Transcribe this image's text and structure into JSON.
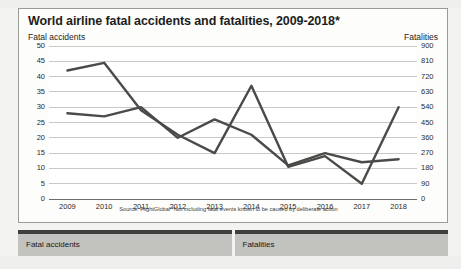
{
  "chart_data": {
    "type": "line",
    "title": "World airline fatal accidents and fatalities, 2009-2018*",
    "xlabel": "",
    "ylabel": "Fatal accidents",
    "y2label": "Fatalities",
    "categories": [
      "2009",
      "2010",
      "2011",
      "2012",
      "2013",
      "2014",
      "2015",
      "2016",
      "2017",
      "2018"
    ],
    "ylim": [
      0,
      50
    ],
    "y2lim": [
      0,
      900
    ],
    "yticks": [
      0,
      5,
      10,
      15,
      20,
      25,
      30,
      35,
      40,
      45,
      50
    ],
    "y2ticks": [
      0,
      90,
      180,
      270,
      360,
      450,
      540,
      630,
      720,
      810,
      900
    ],
    "grid": true,
    "legend_position": "bottom",
    "series": [
      {
        "name": "Fatal accidents",
        "axis": "left",
        "color": "#4a4a48",
        "values": [
          28,
          27,
          30,
          20,
          26,
          21,
          11,
          15,
          12,
          13
        ]
      },
      {
        "name": "Fatalities",
        "axis": "right",
        "color": "#4a4a48",
        "values": [
          756,
          801,
          522,
          378,
          270,
          666,
          189,
          252,
          90,
          540
        ]
      }
    ],
    "annotations": [
      "Source: FlightGlobal *Not including fatal events known to be caused by deliberate action"
    ]
  },
  "chart": {
    "title": "World airline fatal accidents and fatalities, 2009-2018*",
    "left_axis_title": "Fatal accidents",
    "right_axis_title": "Fatalities",
    "source_note": "Source: FlightGlobal *Not including fatal events known to be caused by deliberate action"
  },
  "legend": {
    "items": [
      {
        "label": "Fatal accidents"
      },
      {
        "label": "Fatalities"
      }
    ]
  }
}
